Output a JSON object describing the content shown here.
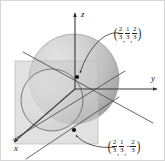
{
  "figure": {
    "background_color": "#ffffff",
    "border_color": "#d6d6d6",
    "axes": {
      "z_label": "z",
      "y_label": "y",
      "x_label": "x",
      "axis_color": "#3a3a3a"
    },
    "sphere": {
      "fill_light": "#d8d8d8",
      "fill_dark": "#a9a9a9",
      "outline_color": "#8e8e8e",
      "center_px": [
        73,
        78
      ],
      "radius_px": 45
    },
    "plane": {
      "fill": "#cfcfcf",
      "opacity": 0.55,
      "outline_color": "#b5b5b5"
    },
    "circle": {
      "outline_color": "#6e6e6e",
      "center_px": [
        51,
        99
      ],
      "radius_px": 31
    },
    "points": [
      {
        "name": "upper-point",
        "marker_px": [
          76,
          76
        ],
        "label": {
          "open_paren": "(",
          "close_paren": ")",
          "coords": [
            {
              "sign": "",
              "num": "2",
              "den": "3"
            },
            {
              "sign": "",
              "num": "1",
              "den": "3"
            },
            {
              "sign": "",
              "num": "2",
              "den": "3"
            }
          ],
          "separator": ",",
          "text_plain": "(2/3, 1/3, 2/3)"
        },
        "label_px": [
          113,
          26
        ]
      },
      {
        "name": "lower-point",
        "marker_px": [
          73,
          129
        ],
        "label": {
          "open_paren": "(",
          "close_paren": ")",
          "coords": [
            {
              "sign": "",
              "num": "2",
              "den": "3"
            },
            {
              "sign": "",
              "num": "1",
              "den": "3"
            },
            {
              "sign": "−",
              "num": "2",
              "den": "3"
            }
          ],
          "separator": ",",
          "text_plain": "(2/3, 1/3, -2/3)"
        },
        "label_px": [
          107,
          139
        ]
      }
    ],
    "lines": {
      "color": "#4a4a4a",
      "count": 3
    }
  }
}
